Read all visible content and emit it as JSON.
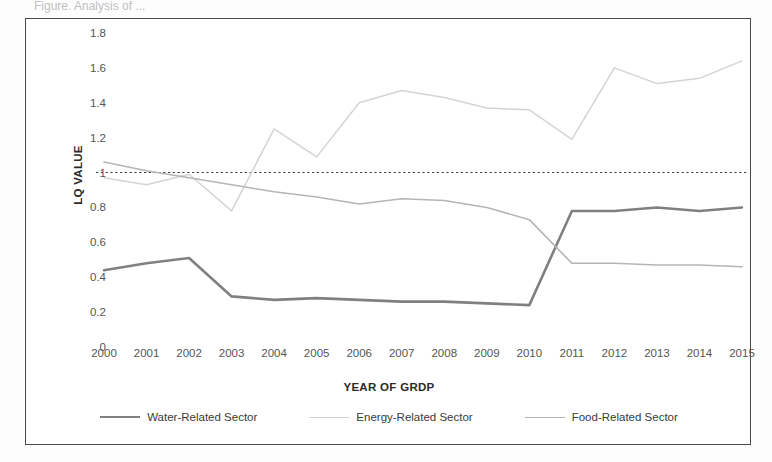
{
  "caption": "Figure. Analysis of ...",
  "chart_data": {
    "type": "line",
    "title": "",
    "xlabel": "YEAR OF GRDP",
    "ylabel": "LQ VALUE",
    "categories": [
      "2000",
      "2001",
      "2002",
      "2003",
      "2004",
      "2005",
      "2006",
      "2007",
      "2008",
      "2009",
      "2010",
      "2011",
      "2012",
      "2013",
      "2014",
      "2015"
    ],
    "x": [
      2000,
      2001,
      2002,
      2003,
      2004,
      2005,
      2006,
      2007,
      2008,
      2009,
      2010,
      2011,
      2012,
      2013,
      2014,
      2015
    ],
    "ylim": [
      0,
      1.8
    ],
    "yticks": [
      "0",
      "0.2",
      "0.4",
      "0.6",
      "0.8",
      "1",
      "1.2",
      "1.4",
      "1.6",
      "1.8"
    ],
    "ytick_values": [
      0,
      0.2,
      0.4,
      0.6,
      0.8,
      1,
      1.2,
      1.4,
      1.6,
      1.8
    ],
    "grid": false,
    "legend_position": "bottom",
    "reference_line": {
      "value": 1.0,
      "style": "dotted",
      "color": "#3d3d3d"
    },
    "series": [
      {
        "name": "Water-Related Sector",
        "color": "#808080",
        "width": 2.6,
        "values": [
          0.44,
          0.48,
          0.51,
          0.29,
          0.27,
          0.28,
          0.27,
          0.26,
          0.26,
          0.25,
          0.24,
          0.78,
          0.78,
          0.8,
          0.78,
          0.8
        ]
      },
      {
        "name": "Energy-Related Sector",
        "color": "#d4d4d4",
        "width": 1.5,
        "values": [
          0.97,
          0.93,
          0.99,
          0.78,
          1.25,
          1.09,
          1.4,
          1.47,
          1.43,
          1.37,
          1.36,
          1.19,
          1.6,
          1.51,
          1.54,
          1.64
        ]
      },
      {
        "name": "Food-Related Sector",
        "color": "#b5b5b5",
        "width": 1.6,
        "values": [
          1.06,
          1.01,
          0.97,
          0.93,
          0.89,
          0.86,
          0.82,
          0.85,
          0.84,
          0.8,
          0.73,
          0.48,
          0.48,
          0.47,
          0.47,
          0.46
        ]
      }
    ]
  }
}
